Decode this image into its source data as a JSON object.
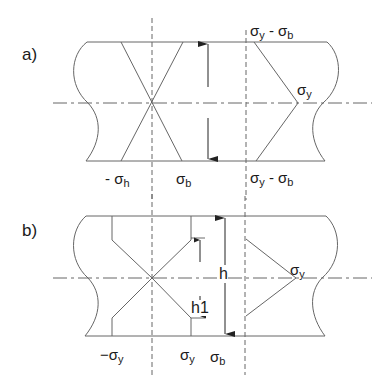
{
  "panels": [
    {
      "id": "a",
      "label": "a)",
      "annotations": {
        "bottom_left": {
          "prefix": "- σ",
          "sub": "h"
        },
        "bottom_mid": {
          "prefix": "σ",
          "sub": "b"
        },
        "top_right": {
          "p1": "σ",
          "s1": "y",
          "mid": " - σ",
          "s2": "b"
        },
        "bottom_right": {
          "p1": "σ",
          "s1": "y",
          "mid": " - σ",
          "s2": "b"
        },
        "apex_right": {
          "prefix": "σ",
          "sub": "y"
        }
      }
    },
    {
      "id": "b",
      "label": "b)",
      "annotations": {
        "bottom_left": {
          "prefix": "−σ",
          "sub": "y"
        },
        "bottom_mid": {
          "prefix": "σ",
          "sub": "y"
        },
        "bottom_right": {
          "prefix": "σ",
          "sub": "b"
        },
        "apex_right": {
          "prefix": "σ",
          "sub": "y"
        },
        "dim_h": "h",
        "dim_h1": "h1"
      }
    }
  ],
  "colors": {
    "line": "#555555",
    "text": "#1a1a1a"
  }
}
